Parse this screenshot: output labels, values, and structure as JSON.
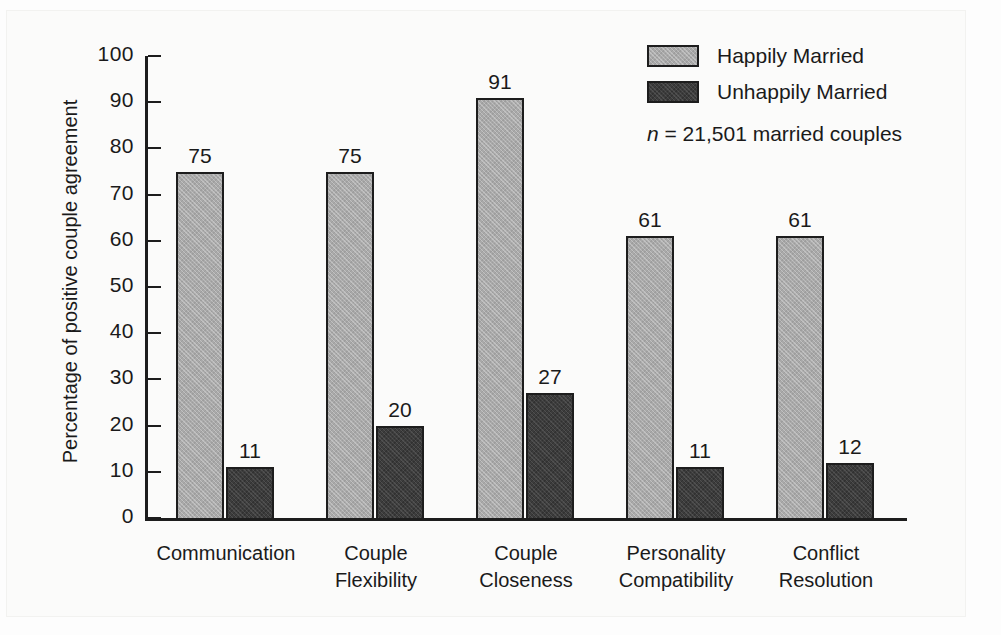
{
  "chart_data": {
    "type": "bar",
    "title": "",
    "subtitle": "",
    "xlabel": "",
    "ylabel": "Percentage of positive couple agreement",
    "ylim": [
      0,
      100
    ],
    "ytick_step": 10,
    "yticks": [
      "100",
      "90",
      "80",
      "70",
      "60",
      "50",
      "40",
      "30",
      "20",
      "10",
      "0"
    ],
    "grid": false,
    "legend_position": "top-right",
    "categories": [
      "Communication",
      "Couple Flexibility",
      "Couple Closeness",
      "Personality Compatibility",
      "Conflict Resolution"
    ],
    "category_lines": [
      [
        "Communication"
      ],
      [
        "Couple",
        "Flexibility"
      ],
      [
        "Couple",
        "Closeness"
      ],
      [
        "Personality",
        "Compatibility"
      ],
      [
        "Conflict",
        "Resolution"
      ]
    ],
    "series": [
      {
        "name": "Happily Married",
        "color": "#a9a9a9",
        "values": [
          75,
          75,
          91,
          61,
          61
        ]
      },
      {
        "name": "Unhappily Married",
        "color": "#3c3c3c",
        "values": [
          11,
          20,
          27,
          11,
          12
        ]
      }
    ],
    "annotations": [
      {
        "name": "sample-size",
        "symbol": "n",
        "text": " = 21,501 married couples"
      }
    ]
  },
  "legend": {
    "items": [
      {
        "label": "Happily Married",
        "swatch": "happy"
      },
      {
        "label": "Unhappily Married",
        "swatch": "unhappy"
      }
    ],
    "note_symbol": "n",
    "note_text": " = 21,501 married couples"
  }
}
